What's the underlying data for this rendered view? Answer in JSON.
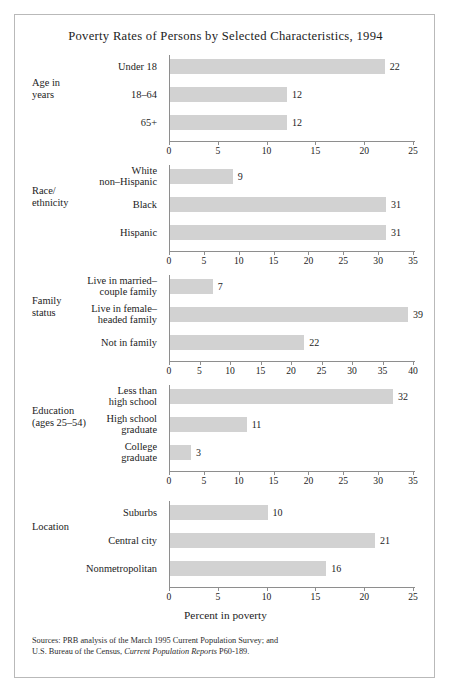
{
  "figure": {
    "title": "Poverty Rates of Persons by Selected Characteristics, 1994",
    "axis_title": "Percent in poverty",
    "sources_line1": "Sources: PRB analysis of the March 1995 Current Population Survey; and",
    "sources_line2_pre": "U.S. Bureau of the Census, ",
    "sources_line2_italic": "Current Population Reports",
    "sources_line2_post": " P60-189.",
    "bar_color": "#d2d2d2",
    "axis_color": "#8e8e8e",
    "frame_color": "#b9b9b9"
  },
  "chart_data": {
    "type": "bar",
    "orientation": "horizontal",
    "title": "Poverty Rates of Persons by Selected Characteristics, 1994",
    "xlabel": "Percent in poverty",
    "ylabel": "",
    "grid": false,
    "legend": "none",
    "units": "percent",
    "panels": [
      {
        "group": "Age in\nyears",
        "group_label_line1": "Age in",
        "group_label_line2": "years",
        "categories": [
          "Under 18",
          "18–64",
          "65+"
        ],
        "values": [
          22,
          12,
          12
        ],
        "xlim": [
          0,
          25
        ],
        "xticks": [
          0,
          5,
          10,
          15,
          20,
          25
        ]
      },
      {
        "group": "Race/\nethnicity",
        "group_label_line1": "Race/",
        "group_label_line2": "ethnicity",
        "categories": [
          "White\nnon–Hispanic",
          "Black",
          "Hispanic"
        ],
        "values": [
          9,
          31,
          31
        ],
        "xlim": [
          0,
          35
        ],
        "xticks": [
          0,
          5,
          10,
          15,
          20,
          25,
          30,
          35
        ]
      },
      {
        "group": "Family\nstatus",
        "group_label_line1": "Family",
        "group_label_line2": "status",
        "categories": [
          "Live in married–\ncouple family",
          "Live in female–\nheaded family",
          "Not in family"
        ],
        "values": [
          7,
          39,
          22
        ],
        "xlim": [
          0,
          40
        ],
        "xticks": [
          0,
          5,
          10,
          15,
          20,
          25,
          30,
          35,
          40
        ]
      },
      {
        "group": "Education\n(ages 25–54)",
        "group_label_line1": "Education",
        "group_label_line2": "(ages 25–54)",
        "categories": [
          "Less than\nhigh school",
          "High school\ngraduate",
          "College\ngraduate"
        ],
        "values": [
          32,
          11,
          3
        ],
        "xlim": [
          0,
          35
        ],
        "xticks": [
          0,
          5,
          10,
          15,
          20,
          25,
          30,
          35
        ]
      },
      {
        "group": "Location",
        "group_label_line1": "Location",
        "group_label_line2": "",
        "categories": [
          "Suburbs",
          "Central city",
          "Nonmetropolitan"
        ],
        "values": [
          10,
          21,
          16
        ],
        "xlim": [
          0,
          25
        ],
        "xticks": [
          0,
          5,
          10,
          15,
          20,
          25
        ]
      }
    ]
  }
}
